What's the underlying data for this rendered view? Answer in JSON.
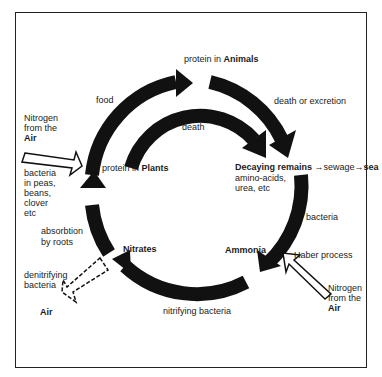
{
  "nodes": {
    "animals": {
      "prefix": "protein in ",
      "bold": "Animals"
    },
    "plants": {
      "prefix": "protein in ",
      "bold": "Plants"
    },
    "decaying": {
      "bold": "Decaying remains",
      "arrow1": " →sewage→",
      "sea": "sea",
      "line2": "amino-acids,",
      "line3": "urea, etc"
    },
    "ammonia": {
      "bold": "Ammonia"
    },
    "nitrates": {
      "bold": "Nitrates"
    },
    "air_bottom": {
      "bold": "Air"
    }
  },
  "edges": {
    "food": "food",
    "death": "death",
    "death_or_excretion": "death or excretion",
    "bacteria": "bacteria",
    "nitrifying_bacteria": "nitrifying bacteria",
    "absorbtion_line1": "absorbtion",
    "absorbtion_line2": "by roots",
    "denitrifying_line1": "denitrifying",
    "denitrifying_line2": "bacteria",
    "haber": "Haber process"
  },
  "inputs": {
    "left_nitrogen": {
      "line1": "Nitrogen",
      "line2": "from the",
      "bold": "Air"
    },
    "left_bacteria": {
      "line1": "bacteria",
      "line2": "in peas,",
      "line3": "beans,",
      "line4": "clover",
      "line5": "etc"
    },
    "right_nitrogen": {
      "line1": "Nitrogen",
      "line2": "from the",
      "bold": "Air"
    }
  },
  "colors": {
    "ink": "#111111",
    "background": "#ffffff"
  }
}
